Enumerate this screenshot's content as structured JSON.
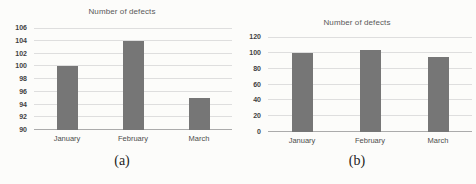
{
  "colors": {
    "bar": "#767676",
    "grid": "#dedede",
    "axis_line": "#ababab",
    "title_text": "#595959",
    "tick_text": "#3f3f3f",
    "background": "#fcfcfa"
  },
  "chart_data": [
    {
      "type": "bar",
      "caption": "(a)",
      "title": "Number of defects",
      "categories": [
        "January",
        "February",
        "March"
      ],
      "values": [
        100,
        104,
        95
      ],
      "xlabel": "",
      "ylabel": "",
      "ylim": [
        90,
        106
      ],
      "yticks": [
        90,
        92,
        94,
        96,
        98,
        100,
        102,
        104,
        106
      ],
      "grid": true,
      "legend": "none"
    },
    {
      "type": "bar",
      "caption": "(b)",
      "title": "Number of defects",
      "categories": [
        "January",
        "February",
        "March"
      ],
      "values": [
        100,
        104,
        95
      ],
      "xlabel": "",
      "ylabel": "",
      "ylim": [
        0,
        120
      ],
      "yticks": [
        0,
        20,
        40,
        60,
        80,
        100,
        120
      ],
      "grid": true,
      "legend": "none"
    }
  ]
}
